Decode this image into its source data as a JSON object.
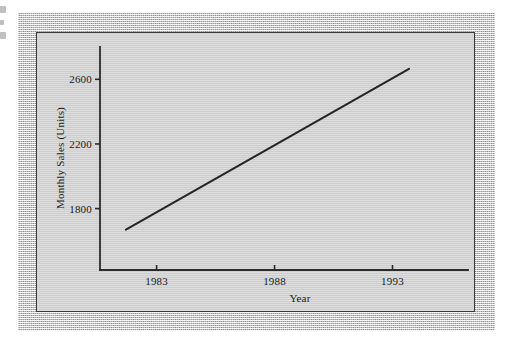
{
  "figure": {
    "background_color": "#ffffff",
    "border_color": "#cfcfcf",
    "panel_color": "#d4d4d4",
    "ink_color": "#262626"
  },
  "chart_data": {
    "type": "line",
    "title": "",
    "subtitle": "",
    "xlabel": "Year",
    "ylabel": "Monthly Sales (Units)",
    "xlim": [
      1980.6,
      1996.2
    ],
    "ylim": [
      1420,
      2800
    ],
    "grid": false,
    "legend": false,
    "legend_position": "none",
    "xticks": [
      1983,
      1988,
      1993
    ],
    "xtick_labels": [
      "1983",
      "1988",
      "1993"
    ],
    "yticks": [
      1800,
      2200,
      2600
    ],
    "ytick_labels": [
      "1800",
      "2200",
      "2600"
    ],
    "series": [
      {
        "name": "Monthly Sales Trend",
        "color": "#262626",
        "style": "solid",
        "x": [
          1981.7,
          1993.7
        ],
        "values": [
          1670,
          2665
        ],
        "points": [
          {
            "x": 1981.7,
            "y": 1670
          },
          {
            "x": 1993.7,
            "y": 2665
          }
        ]
      }
    ],
    "annotations": []
  },
  "edge_bleed": {
    "description": "partial cropped glyph marks from adjacent page",
    "marks": 3
  }
}
